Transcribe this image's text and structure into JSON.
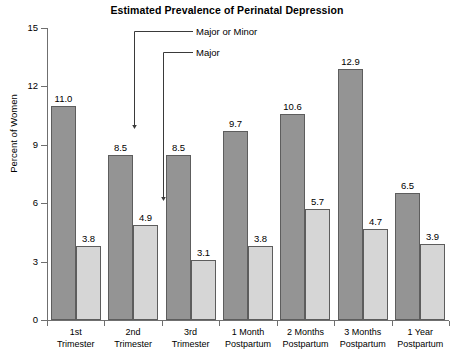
{
  "chart_data": {
    "type": "bar",
    "title": "Estimated Prevalence of Perinatal Depression",
    "xlabel": "",
    "ylabel": "Percent of Women",
    "ylim": [
      0,
      15
    ],
    "yticks": [
      0,
      3,
      6,
      9,
      12,
      15
    ],
    "grid": false,
    "legend_position": "annotation-callouts",
    "categories": [
      "1st Trimester",
      "2nd Trimester",
      "3rd Trimester",
      "1 Month Postpartum",
      "2 Months Postpartum",
      "3 Months Postpartum",
      "1 Year Postpartum"
    ],
    "category_lines": [
      [
        "1st",
        "Trimester"
      ],
      [
        "2nd",
        "Trimester"
      ],
      [
        "3rd",
        "Trimester"
      ],
      [
        "1 Month",
        "Postpartum"
      ],
      [
        "2 Months",
        "Postpartum"
      ],
      [
        "3 Months",
        "Postpartum"
      ],
      [
        "1 Year",
        "Postpartum"
      ]
    ],
    "series": [
      {
        "name": "Major or Minor",
        "color": "#949494",
        "values": [
          11.0,
          8.5,
          8.5,
          9.7,
          10.6,
          12.9,
          6.5
        ],
        "labels": [
          "11.0",
          "8.5",
          "8.5",
          "9.7",
          "10.6",
          "12.9",
          "6.5"
        ]
      },
      {
        "name": "Major",
        "color": "#d6d6d6",
        "values": [
          3.8,
          4.9,
          3.1,
          3.8,
          5.7,
          4.7,
          3.9
        ],
        "labels": [
          "3.8",
          "4.9",
          "3.1",
          "3.8",
          "5.7",
          "4.7",
          "3.9"
        ]
      }
    ],
    "annotations": [
      {
        "text": "Major or Minor",
        "points_to_series": "Major or Minor",
        "points_to_category": "2nd Trimester",
        "value": 8.5
      },
      {
        "text": "Major",
        "points_to_series": "Major",
        "points_to_category": "2nd Trimester",
        "value": 4.9
      }
    ]
  },
  "axis": {
    "ytick_labels": [
      "15",
      "12",
      "9",
      "6",
      "3",
      "0"
    ]
  },
  "colors": {
    "series_major_minor": "#949494",
    "series_major": "#d6d6d6",
    "bar_outline": "#5d5d5d",
    "axis": "#6f6f6f",
    "text": "#000000",
    "background": "#ffffff"
  }
}
